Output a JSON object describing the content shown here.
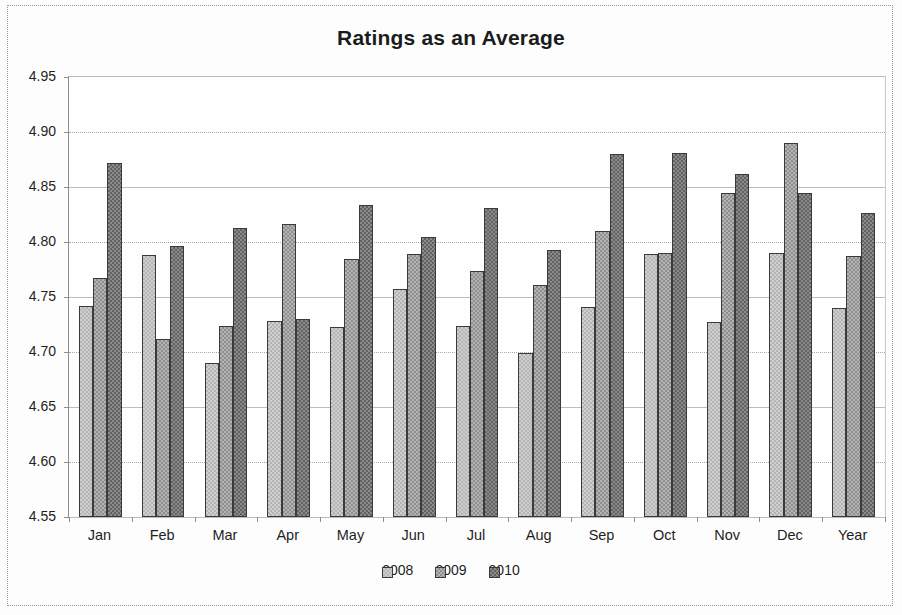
{
  "chart_data": {
    "type": "bar",
    "title": "Ratings as an Average",
    "xlabel": "",
    "ylabel": "",
    "ylim": [
      4.55,
      4.95
    ],
    "ytick_step": 0.05,
    "ytick_labels": [
      "4.95",
      "4.90",
      "4.85",
      "4.80",
      "4.75",
      "4.70",
      "4.65",
      "4.60",
      "4.55"
    ],
    "grid": true,
    "legend_position": "bottom",
    "categories": [
      "Jan",
      "Feb",
      "Mar",
      "Apr",
      "May",
      "Jun",
      "Jul",
      "Aug",
      "Sep",
      "Oct",
      "Nov",
      "Dec",
      "Year"
    ],
    "series": [
      {
        "name": "2008",
        "color": "#cfcfcf",
        "values": [
          4.742,
          4.788,
          4.69,
          4.728,
          4.723,
          4.757,
          4.724,
          4.699,
          4.741,
          4.789,
          4.727,
          4.79,
          4.74
        ]
      },
      {
        "name": "2009",
        "color": "#b3b3b3",
        "values": [
          4.767,
          4.712,
          4.724,
          4.816,
          4.785,
          4.789,
          4.774,
          4.761,
          4.81,
          4.79,
          4.845,
          4.89,
          4.787
        ]
      },
      {
        "name": "2010",
        "color": "#8a8a8a",
        "values": [
          4.872,
          4.796,
          4.813,
          4.73,
          4.834,
          4.805,
          4.831,
          4.793,
          4.88,
          4.881,
          4.862,
          4.845,
          4.826
        ]
      }
    ]
  },
  "legend": {
    "items": [
      {
        "label": "2008"
      },
      {
        "label": "2009"
      },
      {
        "label": "2010"
      }
    ]
  }
}
